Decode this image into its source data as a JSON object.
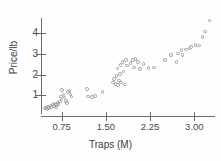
{
  "chart_data": {
    "type": "scatter",
    "title": "",
    "xlabel": "Traps (M)",
    "ylabel": "Price/lb",
    "xticks": [
      0.75,
      1.5,
      2.25,
      3.0
    ],
    "xtick_labels": [
      "0.75",
      "1.50",
      "2.25",
      "3.00"
    ],
    "yticks": [
      1,
      2,
      3,
      4
    ],
    "ytick_labels": [
      "1",
      "2",
      "3",
      "4"
    ],
    "xlim": [
      0.4,
      3.35
    ],
    "ylim": [
      0.0,
      4.75
    ],
    "grid": false,
    "legend": false,
    "marker": "open-circle",
    "marker_color": "#9a9a9a",
    "points": [
      {
        "x": 0.46,
        "y": 0.36
      },
      {
        "x": 0.48,
        "y": 0.42
      },
      {
        "x": 0.5,
        "y": 0.33
      },
      {
        "x": 0.52,
        "y": 0.45
      },
      {
        "x": 0.54,
        "y": 0.38
      },
      {
        "x": 0.56,
        "y": 0.5
      },
      {
        "x": 0.58,
        "y": 0.42
      },
      {
        "x": 0.6,
        "y": 0.55
      },
      {
        "x": 0.62,
        "y": 0.48
      },
      {
        "x": 0.63,
        "y": 0.6
      },
      {
        "x": 0.65,
        "y": 0.52
      },
      {
        "x": 0.66,
        "y": 0.45
      },
      {
        "x": 0.68,
        "y": 0.62
      },
      {
        "x": 0.7,
        "y": 0.58
      },
      {
        "x": 0.72,
        "y": 0.7
      },
      {
        "x": 0.74,
        "y": 0.95
      },
      {
        "x": 0.75,
        "y": 0.8
      },
      {
        "x": 0.76,
        "y": 1.25
      },
      {
        "x": 0.78,
        "y": 1.05
      },
      {
        "x": 0.8,
        "y": 0.9
      },
      {
        "x": 0.82,
        "y": 0.72
      },
      {
        "x": 0.84,
        "y": 0.62
      },
      {
        "x": 0.86,
        "y": 1.15
      },
      {
        "x": 0.88,
        "y": 1.2
      },
      {
        "x": 0.9,
        "y": 1.05
      },
      {
        "x": 0.92,
        "y": 0.95
      },
      {
        "x": 1.18,
        "y": 1.3
      },
      {
        "x": 1.2,
        "y": 0.95
      },
      {
        "x": 1.26,
        "y": 0.92
      },
      {
        "x": 1.32,
        "y": 0.98
      },
      {
        "x": 1.44,
        "y": 1.15
      },
      {
        "x": 1.62,
        "y": 1.62
      },
      {
        "x": 1.64,
        "y": 1.78
      },
      {
        "x": 1.66,
        "y": 1.55
      },
      {
        "x": 1.68,
        "y": 1.95
      },
      {
        "x": 1.7,
        "y": 2.3
      },
      {
        "x": 1.71,
        "y": 1.5
      },
      {
        "x": 1.72,
        "y": 1.72
      },
      {
        "x": 1.74,
        "y": 2.05
      },
      {
        "x": 1.75,
        "y": 2.48
      },
      {
        "x": 1.76,
        "y": 1.62
      },
      {
        "x": 1.78,
        "y": 2.62
      },
      {
        "x": 1.8,
        "y": 2.15
      },
      {
        "x": 1.82,
        "y": 1.52
      },
      {
        "x": 1.84,
        "y": 2.7
      },
      {
        "x": 1.86,
        "y": 2.45
      },
      {
        "x": 1.92,
        "y": 2.58
      },
      {
        "x": 1.96,
        "y": 2.72
      },
      {
        "x": 1.98,
        "y": 2.35
      },
      {
        "x": 2.0,
        "y": 2.75
      },
      {
        "x": 2.04,
        "y": 2.62
      },
      {
        "x": 2.08,
        "y": 2.28
      },
      {
        "x": 2.14,
        "y": 2.52
      },
      {
        "x": 2.22,
        "y": 2.32
      },
      {
        "x": 2.32,
        "y": 2.35
      },
      {
        "x": 2.5,
        "y": 2.72
      },
      {
        "x": 2.6,
        "y": 2.96
      },
      {
        "x": 2.7,
        "y": 2.62
      },
      {
        "x": 2.72,
        "y": 3.02
      },
      {
        "x": 2.78,
        "y": 3.2
      },
      {
        "x": 2.8,
        "y": 2.95
      },
      {
        "x": 2.86,
        "y": 3.22
      },
      {
        "x": 2.92,
        "y": 3.28
      },
      {
        "x": 2.94,
        "y": 3.35
      },
      {
        "x": 3.02,
        "y": 3.45
      },
      {
        "x": 3.08,
        "y": 3.42
      },
      {
        "x": 3.14,
        "y": 3.82
      },
      {
        "x": 3.18,
        "y": 4.1
      },
      {
        "x": 3.26,
        "y": 4.62
      }
    ]
  }
}
